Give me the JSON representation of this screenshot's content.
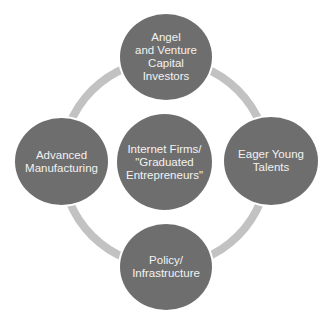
{
  "diagram": {
    "type": "cycle",
    "colors": {
      "node_fill": "#6e6e6e",
      "ring": "#c2c2c2",
      "text": "#f2f2f2",
      "background": "#ffffff"
    },
    "center": {
      "label": "Internet Firms/\n\"Graduated\nEntrepreneurs\""
    },
    "nodes": [
      {
        "position": "top",
        "label": "Angel\nand Venture\nCapital\nInvestors"
      },
      {
        "position": "right",
        "label": "Eager Young\nTalents"
      },
      {
        "position": "bottom",
        "label": "Policy/\nInfrastructure"
      },
      {
        "position": "left",
        "label": "Advanced\nManufacturing"
      }
    ]
  }
}
